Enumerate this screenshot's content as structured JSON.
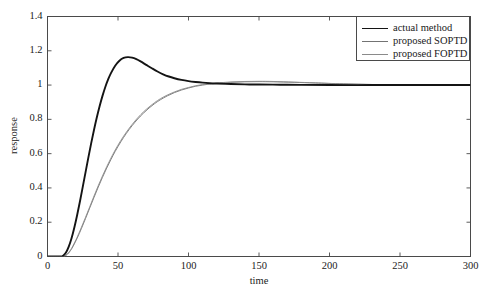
{
  "chart_data": {
    "type": "line",
    "title": "",
    "xlabel": "time",
    "ylabel": "response",
    "xlim": [
      0,
      300
    ],
    "ylim": [
      0,
      1.4
    ],
    "xticks": [
      0,
      50,
      100,
      150,
      200,
      250,
      300
    ],
    "yticks": [
      0,
      0.2,
      0.4,
      0.6,
      0.8,
      1,
      1.2,
      1.4
    ],
    "xtick_labels": [
      "0",
      "50",
      "100",
      "150",
      "200",
      "250",
      "300"
    ],
    "ytick_labels": [
      "0",
      "0.2",
      "0.4",
      "0.6",
      "0.8",
      "1",
      "1.2",
      "1.4"
    ],
    "grid": false,
    "legend_position": "upper right",
    "legend_entries": [
      "actual method",
      "proposed SOPTD",
      "proposed FOPTD"
    ],
    "series": [
      {
        "name": "actual method",
        "color": "#141414",
        "width": 1.9,
        "style": "solid",
        "x": [
          0,
          5,
          10,
          11,
          13,
          15,
          17,
          19,
          21,
          23,
          25,
          27,
          29,
          31,
          33,
          35,
          37,
          39,
          41,
          43,
          45,
          48,
          51,
          54,
          57,
          60,
          63,
          66,
          70,
          74,
          78,
          82,
          86,
          90,
          95,
          100,
          105,
          110,
          115,
          120,
          130,
          140,
          150,
          165,
          180,
          200,
          230,
          260,
          300
        ],
        "y": [
          0,
          0,
          0,
          0.004,
          0.022,
          0.056,
          0.105,
          0.168,
          0.241,
          0.321,
          0.406,
          0.492,
          0.578,
          0.661,
          0.739,
          0.812,
          0.878,
          0.937,
          0.989,
          1.033,
          1.07,
          1.113,
          1.142,
          1.158,
          1.163,
          1.16,
          1.151,
          1.138,
          1.118,
          1.098,
          1.079,
          1.063,
          1.05,
          1.04,
          1.03,
          1.023,
          1.018,
          1.014,
          1.011,
          1.009,
          1.006,
          1.004,
          1.003,
          1.002,
          1.001,
          1.0,
          1.0,
          1.0,
          1.0
        ]
      },
      {
        "name": "proposed SOPTD",
        "color": "#737373",
        "width": 0.9,
        "style": "solid",
        "x": [
          0,
          5,
          10,
          12,
          14,
          16,
          18,
          21,
          24,
          27,
          30,
          33,
          36,
          39,
          42,
          45,
          48,
          52,
          56,
          60,
          64,
          68,
          72,
          76,
          80,
          85,
          90,
          95,
          100,
          105,
          110,
          115,
          120,
          130,
          140,
          150,
          160,
          175,
          190,
          210,
          240,
          270,
          300
        ],
        "y": [
          0,
          0,
          0,
          0.002,
          0.012,
          0.031,
          0.057,
          0.106,
          0.162,
          0.222,
          0.284,
          0.345,
          0.405,
          0.462,
          0.516,
          0.566,
          0.613,
          0.669,
          0.719,
          0.763,
          0.802,
          0.836,
          0.866,
          0.892,
          0.914,
          0.937,
          0.956,
          0.971,
          0.983,
          0.993,
          1.0,
          1.006,
          1.01,
          1.016,
          1.019,
          1.02,
          1.019,
          1.016,
          1.012,
          1.007,
          1.002,
          1.0,
          1.0
        ]
      },
      {
        "name": "proposed FOPTD",
        "color": "#8a8a8a",
        "width": 0.9,
        "style": "solid",
        "x": [
          0,
          5,
          10,
          12,
          14,
          16,
          18,
          21,
          24,
          27,
          30,
          33,
          36,
          39,
          42,
          45,
          48,
          52,
          56,
          60,
          64,
          68,
          72,
          76,
          80,
          85,
          90,
          95,
          100,
          105,
          110,
          115,
          120,
          130,
          140,
          150,
          160,
          175,
          190,
          210,
          240,
          270,
          300
        ],
        "y": [
          0,
          0,
          0,
          0.003,
          0.014,
          0.034,
          0.062,
          0.112,
          0.169,
          0.229,
          0.291,
          0.353,
          0.413,
          0.47,
          0.524,
          0.574,
          0.621,
          0.677,
          0.726,
          0.77,
          0.809,
          0.843,
          0.872,
          0.898,
          0.92,
          0.942,
          0.96,
          0.975,
          0.986,
          0.996,
          1.003,
          1.008,
          1.012,
          1.018,
          1.021,
          1.022,
          1.021,
          1.017,
          1.013,
          1.007,
          1.002,
          1.0,
          1.0
        ]
      }
    ]
  }
}
